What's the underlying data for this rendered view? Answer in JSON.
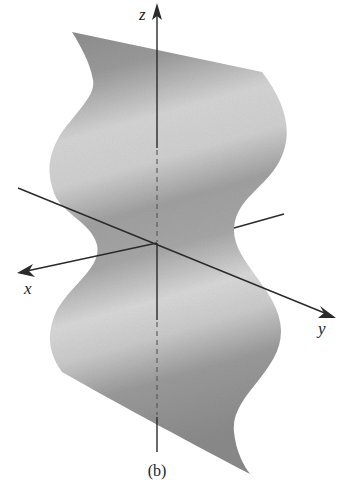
{
  "figure": {
    "caption": "(b)",
    "surface": {
      "fill_colors": {
        "dark": "#8a8a8a",
        "mid": "#a8a8a8",
        "light": "#d6d6d6"
      }
    },
    "axes": {
      "x": {
        "label": "x"
      },
      "y": {
        "label": "y"
      },
      "z": {
        "label": "z"
      },
      "color": "#2a2a2a"
    }
  }
}
